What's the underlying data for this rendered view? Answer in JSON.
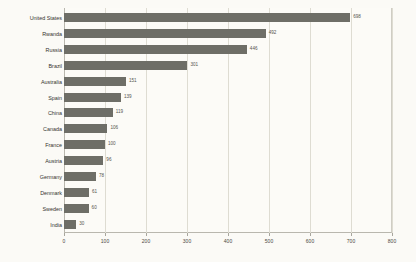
{
  "chart_data": {
    "type": "bar",
    "orientation": "horizontal",
    "title": "",
    "subtitle": "",
    "xlabel": "",
    "ylabel": "",
    "xlim": [
      0,
      800
    ],
    "xticks": [
      0,
      100,
      200,
      300,
      400,
      500,
      600,
      700,
      800
    ],
    "xtick_labels": [
      "0",
      "100",
      "200",
      "300",
      "400",
      "500",
      "600",
      "700",
      "800"
    ],
    "grid": true,
    "grid_axis": "x",
    "legend": false,
    "legend_position": "none",
    "bar_color": "#6e6e67",
    "background_color": "#fbfaf6",
    "axis_color": "#b9b7ae",
    "gridline_color": "#dedcd2",
    "value_label_color": "#56554f",
    "category_label_color": "#35342f",
    "show_value_labels": true,
    "categories": [
      "United States",
      "Rwanda",
      "Russia",
      "Brazil",
      "Australia",
      "Spain",
      "China",
      "Canada",
      "France",
      "Austria",
      "Germany",
      "Denmark",
      "Sweden",
      "India"
    ],
    "values": [
      698,
      492,
      446,
      301,
      151,
      139,
      119,
      106,
      100,
      96,
      78,
      61,
      60,
      30
    ],
    "value_labels": [
      "698",
      "492",
      "446",
      "301",
      "151",
      "139",
      "119",
      "106",
      "100",
      "96",
      "78",
      "61",
      "60",
      "30"
    ]
  }
}
